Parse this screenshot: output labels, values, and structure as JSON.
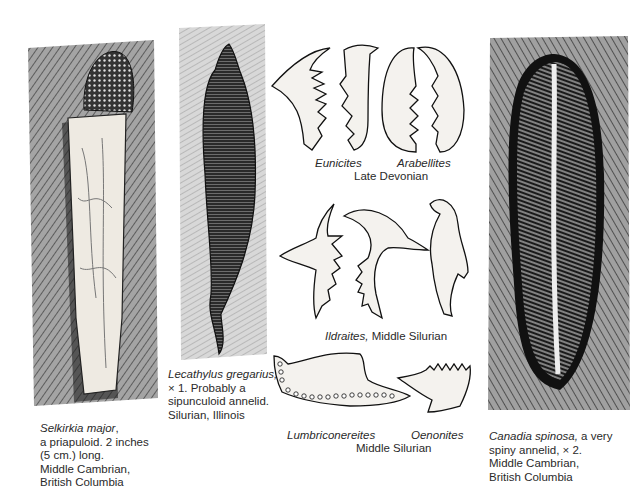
{
  "plate": {
    "figures": [
      {
        "id": "selkirkia",
        "name": "Selkirkia major",
        "caption_lines": [
          "a priapuloid. 2 inches",
          "(5 cm.) long.",
          "Middle Cambrian,",
          "British Columbia"
        ]
      },
      {
        "id": "lecathylus",
        "name": "Lecathylus gregarius,",
        "caption_lines": [
          "× 1. Probably a",
          "sipunculoid annelid.",
          "Silurian, Illinois"
        ]
      },
      {
        "id": "eunicites_arabellites",
        "labels": [
          "Eunicites",
          "Arabellites"
        ],
        "period": "Late Devonian"
      },
      {
        "id": "ildraites",
        "name": "Ildraites,",
        "period": "Middle Silurian"
      },
      {
        "id": "lumbriconereites_oenonites",
        "labels": [
          "Lumbriconereites",
          "Oenonites"
        ],
        "period": "Middle Silurian"
      },
      {
        "id": "canadia",
        "name": "Canadia spinosa,",
        "caption_lines": [
          "a very",
          "spiny annelid, × 2.",
          "Middle Cambrian,",
          "British Columbia"
        ]
      }
    ]
  },
  "colors": {
    "ink": "#1a1a1a",
    "rock": "#8a8a8a",
    "paper": "#ffffff"
  }
}
